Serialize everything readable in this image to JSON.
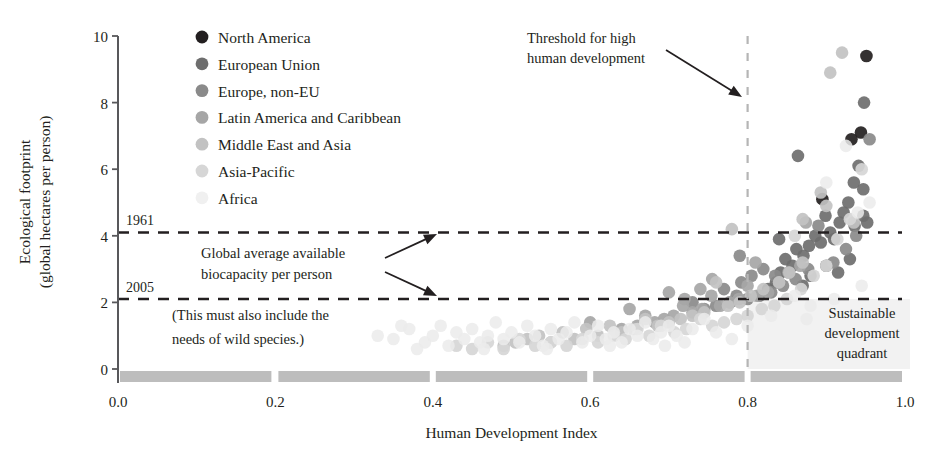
{
  "chart_data": {
    "type": "scatter",
    "title": "",
    "xlabel": "Human Development Index",
    "ylabel": "Ecological footprint\n(global hectares per person)",
    "ylabel_line1": "Ecological footprint",
    "ylabel_line2": "(global hectares per person)",
    "xlim": [
      0.0,
      1.0
    ],
    "ylim": [
      0,
      10
    ],
    "xticks": [
      "0.0",
      "0.2",
      "0.4",
      "0.6",
      "0.8",
      "1.0"
    ],
    "xtick_values": [
      0.0,
      0.2,
      0.4,
      0.6,
      0.8,
      1.0
    ],
    "yticks": [
      "0",
      "2",
      "4",
      "6",
      "8",
      "10"
    ],
    "ytick_values": [
      0,
      2,
      4,
      6,
      8,
      10
    ],
    "grid": false,
    "legend_position": "top-left-inside",
    "reference_lines": [
      {
        "name": "1961-biocapacity",
        "orientation": "horizontal",
        "value": 4.1,
        "label": "1961",
        "style": "dashed"
      },
      {
        "name": "2005-biocapacity",
        "orientation": "horizontal",
        "value": 2.1,
        "label": "2005",
        "style": "dashed"
      },
      {
        "name": "high-development-threshold",
        "orientation": "vertical",
        "value": 0.8,
        "label": "",
        "style": "dashed"
      }
    ],
    "annotations": [
      {
        "name": "threshold-annotation",
        "text_line1": "Threshold for high",
        "text_line2": "human development",
        "x": 0.62,
        "y": 9.2
      },
      {
        "name": "biocapacity-annotation",
        "text_line1": "Global average available",
        "text_line2": "biocapacity per person",
        "x": 0.26,
        "y": 3.4
      },
      {
        "name": "wild-species-annotation",
        "text_line1": "(This must also include the",
        "text_line2": "needs of wild species.)",
        "x": 0.24,
        "y": 1.75
      },
      {
        "name": "sustainable-quadrant-annotation",
        "text_line1": "Sustainable",
        "text_line2": "development",
        "text_line3": "quadrant",
        "x": 0.9,
        "y": 1.5
      }
    ],
    "series": [
      {
        "name": "North America",
        "color": "#231f20",
        "points": [
          [
            0.951,
            9.4
          ],
          [
            0.944,
            7.1
          ],
          [
            0.932,
            6.9
          ],
          [
            0.895,
            5.1
          ]
        ]
      },
      {
        "name": "European Union",
        "color": "#6e6e6e",
        "points": [
          [
            0.948,
            8.0
          ],
          [
            0.941,
            6.1
          ],
          [
            0.935,
            5.6
          ],
          [
            0.928,
            5.0
          ],
          [
            0.947,
            5.4
          ],
          [
            0.922,
            4.7
          ],
          [
            0.947,
            4.6
          ],
          [
            0.936,
            4.3
          ],
          [
            0.952,
            4.4
          ],
          [
            0.917,
            4.4
          ],
          [
            0.905,
            4.1
          ],
          [
            0.899,
            4.6
          ],
          [
            0.91,
            3.9
          ],
          [
            0.893,
            3.8
          ],
          [
            0.886,
            4.0
          ],
          [
            0.878,
            3.7
          ],
          [
            0.871,
            3.4
          ],
          [
            0.864,
            6.4
          ],
          [
            0.857,
            3.1
          ],
          [
            0.862,
            3.6
          ],
          [
            0.848,
            3.3
          ],
          [
            0.842,
            2.9
          ],
          [
            0.836,
            2.6
          ],
          [
            0.87,
            2.5
          ],
          [
            0.88,
            2.8
          ],
          [
            0.9,
            3.1
          ],
          [
            0.915,
            2.9
          ],
          [
            0.93,
            3.3
          ],
          [
            0.84,
            3.9
          ],
          [
            0.826,
            2.4
          ]
        ]
      },
      {
        "name": "Europe, non-EU",
        "color": "#8a8a8a",
        "points": [
          [
            0.955,
            6.9
          ],
          [
            0.938,
            4.0
          ],
          [
            0.925,
            3.6
          ],
          [
            0.909,
            3.2
          ],
          [
            0.89,
            4.3
          ],
          [
            0.877,
            3.0
          ],
          [
            0.861,
            2.7
          ],
          [
            0.845,
            2.5
          ],
          [
            0.83,
            2.3
          ],
          [
            0.815,
            2.2
          ],
          [
            0.8,
            2.1
          ],
          [
            0.792,
            2.6
          ],
          [
            0.786,
            2.2
          ],
          [
            0.778,
            2.0
          ],
          [
            0.805,
            2.8
          ],
          [
            0.82,
            3.0
          ],
          [
            0.835,
            2.8
          ],
          [
            0.76,
            1.9
          ],
          [
            0.745,
            1.8
          ],
          [
            0.73,
            2.0
          ],
          [
            0.79,
            3.4
          ],
          [
            0.77,
            2.4
          ]
        ]
      },
      {
        "name": "Latin America and Caribbean",
        "color": "#a6a6a6",
        "points": [
          [
            0.874,
            4.4
          ],
          [
            0.867,
            3.1
          ],
          [
            0.852,
            2.9
          ],
          [
            0.84,
            2.6
          ],
          [
            0.826,
            2.3
          ],
          [
            0.812,
            2.2
          ],
          [
            0.8,
            2.5
          ],
          [
            0.789,
            2.1
          ],
          [
            0.777,
            2.0
          ],
          [
            0.765,
            1.9
          ],
          [
            0.754,
            2.2
          ],
          [
            0.742,
            1.8
          ],
          [
            0.73,
            1.7
          ],
          [
            0.718,
            1.9
          ],
          [
            0.706,
            1.6
          ],
          [
            0.7,
            2.3
          ],
          [
            0.694,
            1.5
          ],
          [
            0.682,
            1.4
          ],
          [
            0.67,
            1.6
          ],
          [
            0.66,
            1.3
          ],
          [
            0.755,
            2.7
          ],
          [
            0.81,
            3.2
          ],
          [
            0.74,
            2.4
          ],
          [
            0.72,
            2.1
          ],
          [
            0.65,
            1.8
          ],
          [
            0.64,
            1.2
          ],
          [
            0.6,
            1.4
          ]
        ]
      },
      {
        "name": "Middle East and Asia",
        "color": "#c2c2c2",
        "points": [
          [
            0.92,
            9.5
          ],
          [
            0.905,
            8.9
          ],
          [
            0.893,
            5.3
          ],
          [
            0.9,
            4.9
          ],
          [
            0.87,
            3.2
          ],
          [
            0.853,
            2.9
          ],
          [
            0.84,
            2.6
          ],
          [
            0.82,
            2.4
          ],
          [
            0.804,
            2.2
          ],
          [
            0.79,
            2.0
          ],
          [
            0.775,
            1.9
          ],
          [
            0.76,
            2.6
          ],
          [
            0.745,
            1.7
          ],
          [
            0.73,
            1.6
          ],
          [
            0.715,
            1.5
          ],
          [
            0.7,
            1.4
          ],
          [
            0.686,
            1.3
          ],
          [
            0.67,
            1.5
          ],
          [
            0.655,
            1.2
          ],
          [
            0.64,
            1.1
          ],
          [
            0.625,
            1.3
          ],
          [
            0.61,
            1.0
          ],
          [
            0.595,
            1.2
          ],
          [
            0.58,
            0.9
          ],
          [
            0.565,
            1.1
          ],
          [
            0.55,
            0.8
          ],
          [
            0.535,
            1.0
          ],
          [
            0.52,
            0.9
          ],
          [
            0.505,
            0.8
          ],
          [
            0.49,
            0.7
          ],
          [
            0.78,
            4.2
          ],
          [
            0.87,
            4.5
          ],
          [
            0.935,
            4.4
          ]
        ]
      },
      {
        "name": "Asia-Pacific",
        "color": "#d6d6d6",
        "points": [
          [
            0.945,
            6.0
          ],
          [
            0.93,
            4.5
          ],
          [
            0.914,
            3.9
          ],
          [
            0.9,
            3.1
          ],
          [
            0.884,
            2.8
          ],
          [
            0.868,
            2.4
          ],
          [
            0.85,
            2.1
          ],
          [
            0.834,
            1.9
          ],
          [
            0.818,
            1.8
          ],
          [
            0.8,
            1.6
          ],
          [
            0.786,
            1.5
          ],
          [
            0.77,
            1.4
          ],
          [
            0.755,
            1.3
          ],
          [
            0.74,
            1.5
          ],
          [
            0.722,
            1.2
          ],
          [
            0.707,
            1.1
          ],
          [
            0.69,
            1.3
          ],
          [
            0.675,
            1.0
          ],
          [
            0.66,
            1.2
          ],
          [
            0.645,
            0.9
          ],
          [
            0.63,
            1.0
          ],
          [
            0.61,
            0.8
          ],
          [
            0.59,
            0.9
          ],
          [
            0.57,
            0.7
          ],
          [
            0.55,
            0.8
          ],
          [
            0.53,
            0.7
          ],
          [
            0.51,
            0.9
          ],
          [
            0.49,
            0.6
          ],
          [
            0.47,
            0.8
          ],
          [
            0.45,
            0.6
          ],
          [
            0.43,
            0.7
          ],
          [
            0.86,
            4.0
          ]
        ]
      },
      {
        "name": "Africa",
        "color": "#ebebeb",
        "points": [
          [
            0.35,
            0.9
          ],
          [
            0.37,
            1.2
          ],
          [
            0.39,
            0.8
          ],
          [
            0.4,
            1.0
          ],
          [
            0.41,
            1.3
          ],
          [
            0.42,
            0.7
          ],
          [
            0.43,
            1.1
          ],
          [
            0.44,
            0.9
          ],
          [
            0.45,
            1.2
          ],
          [
            0.46,
            0.8
          ],
          [
            0.47,
            1.0
          ],
          [
            0.48,
            1.4
          ],
          [
            0.49,
            0.9
          ],
          [
            0.5,
            1.1
          ],
          [
            0.51,
            0.8
          ],
          [
            0.52,
            1.3
          ],
          [
            0.53,
            1.0
          ],
          [
            0.54,
            0.7
          ],
          [
            0.55,
            1.2
          ],
          [
            0.56,
            0.9
          ],
          [
            0.57,
            1.1
          ],
          [
            0.58,
            1.4
          ],
          [
            0.59,
            0.8
          ],
          [
            0.6,
            1.0
          ],
          [
            0.61,
            1.3
          ],
          [
            0.62,
            0.9
          ],
          [
            0.63,
            1.1
          ],
          [
            0.64,
            0.8
          ],
          [
            0.65,
            1.2
          ],
          [
            0.66,
            1.0
          ],
          [
            0.67,
            1.4
          ],
          [
            0.68,
            0.9
          ],
          [
            0.69,
            1.1
          ],
          [
            0.7,
            1.3
          ],
          [
            0.71,
            1.0
          ],
          [
            0.72,
            0.8
          ],
          [
            0.73,
            1.2
          ],
          [
            0.745,
            1.5
          ],
          [
            0.76,
            1.1
          ],
          [
            0.78,
            0.9
          ],
          [
            0.33,
            1.0
          ],
          [
            0.36,
            1.3
          ],
          [
            0.38,
            0.6
          ],
          [
            0.465,
            0.6
          ],
          [
            0.545,
            0.6
          ],
          [
            0.625,
            0.7
          ],
          [
            0.695,
            0.7
          ],
          [
            0.8,
            1.3
          ],
          [
            0.83,
            1.6
          ],
          [
            0.86,
            2.2
          ],
          [
            0.88,
            1.9
          ],
          [
            0.9,
            5.6
          ],
          [
            0.925,
            6.7
          ],
          [
            0.94,
            4.7
          ],
          [
            0.955,
            5.0
          ],
          [
            0.945,
            2.5
          ],
          [
            0.91,
            2.1
          ],
          [
            0.875,
            1.5
          ]
        ]
      }
    ]
  },
  "legend": {
    "items": [
      {
        "label": "North America",
        "color": "#231f20"
      },
      {
        "label": "European Union",
        "color": "#6e6e6e"
      },
      {
        "label": "Europe, non-EU",
        "color": "#8a8a8a"
      },
      {
        "label": "Latin America and Caribbean",
        "color": "#a6a6a6"
      },
      {
        "label": "Middle East and Asia",
        "color": "#c2c2c2"
      },
      {
        "label": "Asia-Pacific",
        "color": "#d6d6d6"
      },
      {
        "label": "Africa",
        "color": "#f0f0f0"
      }
    ]
  },
  "colors": {
    "axis": "#58585b",
    "text": "#231f20",
    "dashed_line": "#231f20",
    "threshold_line": "#b5b5b5",
    "baseline_band": "#bdbdbd",
    "quadrant_shade": "#f2f2f2"
  },
  "axis": {
    "x_title": "Human Development Index",
    "y_title_line1": "Ecological footprint",
    "y_title_line2": "(global hectares per person)"
  }
}
